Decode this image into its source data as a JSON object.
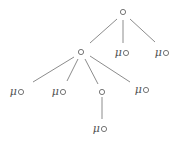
{
  "diagram": {
    "type": "tree",
    "colors": {
      "edge": "#8c8c8c",
      "text": "#555555",
      "node": "#666666",
      "background": "#ffffff"
    },
    "nodes": [
      {
        "id": "root",
        "label": "",
        "x": 123,
        "y": 12,
        "mu": false
      },
      {
        "id": "n1",
        "label": "",
        "x": 81,
        "y": 52,
        "mu": false
      },
      {
        "id": "n2",
        "label": "μ",
        "x": 124,
        "y": 52,
        "mu": true
      },
      {
        "id": "n3",
        "label": "μ",
        "x": 164,
        "y": 52,
        "mu": true
      },
      {
        "id": "n4",
        "label": "μ",
        "x": 19,
        "y": 91,
        "mu": true
      },
      {
        "id": "n5",
        "label": "μ",
        "x": 61,
        "y": 91,
        "mu": true
      },
      {
        "id": "n6",
        "label": "",
        "x": 102,
        "y": 92,
        "mu": false
      },
      {
        "id": "n7",
        "label": "μ",
        "x": 144,
        "y": 89,
        "mu": true
      },
      {
        "id": "n8",
        "label": "μ",
        "x": 102,
        "y": 128,
        "mu": true
      }
    ],
    "edges": [
      {
        "from": "root",
        "to": "n1",
        "x1": 117,
        "y1": 19,
        "x2": 90,
        "y2": 43
      },
      {
        "from": "root",
        "to": "n2",
        "x1": 123,
        "y1": 20,
        "x2": 123,
        "y2": 43
      },
      {
        "from": "root",
        "to": "n3",
        "x1": 130,
        "y1": 19,
        "x2": 155,
        "y2": 42
      },
      {
        "from": "n1",
        "to": "n4",
        "x1": 74,
        "y1": 57,
        "x2": 33,
        "y2": 82
      },
      {
        "from": "n1",
        "to": "n5",
        "x1": 78,
        "y1": 59,
        "x2": 67,
        "y2": 81
      },
      {
        "from": "n1",
        "to": "n6",
        "x1": 85,
        "y1": 59,
        "x2": 98,
        "y2": 84
      },
      {
        "from": "n1",
        "to": "n7",
        "x1": 90,
        "y1": 56,
        "x2": 130,
        "y2": 82
      },
      {
        "from": "n6",
        "to": "n8",
        "x1": 102,
        "y1": 97,
        "x2": 102,
        "y2": 119
      }
    ]
  }
}
